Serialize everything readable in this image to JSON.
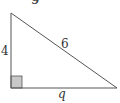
{
  "question_number": "9",
  "triangle": {
    "type": "right-triangle",
    "vertices": {
      "top": [
        11,
        13
      ],
      "right_angle": [
        11,
        88
      ],
      "bottom_right": [
        117,
        88
      ]
    },
    "sides": {
      "vertical_leg": "4",
      "hypotenuse": "6",
      "horizontal_leg": "q"
    },
    "right_angle_marker": {
      "size": 11,
      "fill": "#c8c8c8",
      "stroke": "#555555"
    },
    "line_color": "#555555"
  }
}
